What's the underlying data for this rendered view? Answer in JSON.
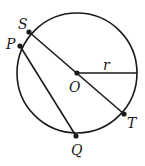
{
  "diagram": {
    "type": "circle-geometry",
    "colors": {
      "stroke": "#1a1a1a",
      "background": "#ffffff"
    },
    "circle": {
      "center_label": "O",
      "radius_label": "r"
    },
    "points": {
      "S": {
        "label": "S"
      },
      "P": {
        "label": "P"
      },
      "O": {
        "label": "O"
      },
      "T": {
        "label": "T"
      },
      "Q": {
        "label": "Q"
      }
    },
    "segments": [
      {
        "from": "S",
        "to": "T",
        "description": "diameter through O"
      },
      {
        "from": "P",
        "to": "Q",
        "description": "chord parallel to ST"
      },
      {
        "from": "O",
        "to": "circle-right",
        "description": "radius r"
      }
    ]
  }
}
